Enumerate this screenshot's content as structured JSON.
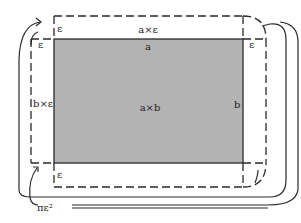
{
  "diagram": {
    "colors": {
      "fill": "#b3b3b3",
      "stroke": "#2a2a2a",
      "background": "#ffffff"
    },
    "labels": {
      "top_strip": "a×ε",
      "top_side": "a",
      "left_strip": "b×ε",
      "center": "a×b",
      "right_side": "b",
      "corner_tl_top": "ε",
      "corner_tl_left": "ε",
      "corner_tr": "ε",
      "corner_bl": "ε",
      "corners_total": "πε²"
    }
  }
}
